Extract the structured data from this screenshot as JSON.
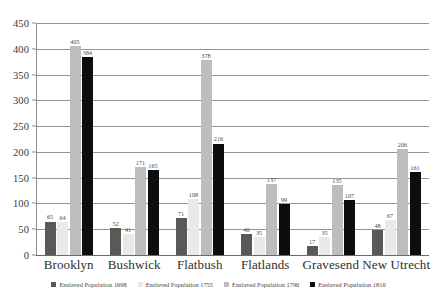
{
  "chart_data": {
    "type": "bar",
    "title": "",
    "xlabel": "",
    "ylabel": "",
    "ylim": [
      0,
      450
    ],
    "ytick_step": 50,
    "yticks": [
      0,
      50,
      100,
      150,
      200,
      250,
      300,
      350,
      400,
      450
    ],
    "grid": true,
    "legend_position": "bottom",
    "categories": [
      "Brooklyn",
      "Bushwick",
      "Flatbush",
      "Flatlands",
      "Gravesend",
      "New Utrecht"
    ],
    "series": [
      {
        "name": "Enslaved Population 1698",
        "color": "#595959",
        "values": [
          65,
          52,
          71,
          40,
          17,
          48
        ]
      },
      {
        "name": "Enslaved Population 1755",
        "color": "#E9E9E9",
        "values": [
          64,
          41,
          108,
          35,
          35,
          67
        ]
      },
      {
        "name": "Enslaved Population 1790",
        "color": "#BDBDBD",
        "values": [
          405,
          171,
          378,
          137,
          135,
          206
        ]
      },
      {
        "name": "Enslaved Population 1810",
        "color": "#0D0D0D",
        "values": [
          384,
          165,
          216,
          99,
          107,
          161
        ]
      }
    ]
  }
}
